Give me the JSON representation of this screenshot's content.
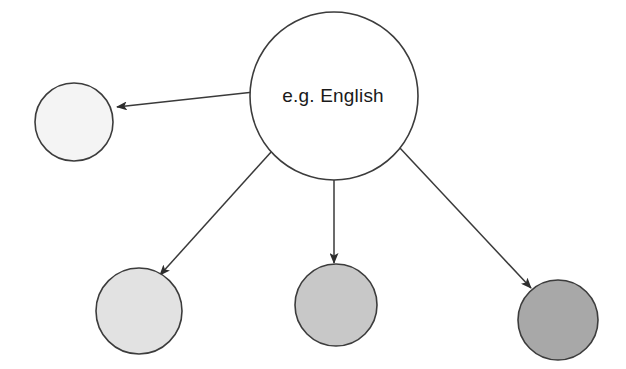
{
  "canvas": {
    "width": 626,
    "height": 369,
    "background": "#ffffff"
  },
  "diagram": {
    "type": "radial-node-link",
    "title": "",
    "nodes": [
      {
        "id": "center",
        "label": "e.g. English",
        "cx": 334,
        "cy": 96,
        "r": 84,
        "fill": "#ffffff",
        "stroke": "#3c3c3c",
        "shade_rank": 0
      },
      {
        "id": "left",
        "label": "",
        "cx": 74,
        "cy": 122,
        "r": 39,
        "fill": "#f4f4f4",
        "stroke": "#3c3c3c",
        "shade_rank": 1
      },
      {
        "id": "bottom-left",
        "label": "",
        "cx": 139,
        "cy": 311,
        "r": 43,
        "fill": "#e2e2e2",
        "stroke": "#3c3c3c",
        "shade_rank": 2
      },
      {
        "id": "bottom-middle",
        "label": "",
        "cx": 336,
        "cy": 305,
        "r": 41,
        "fill": "#c8c8c8",
        "stroke": "#3c3c3c",
        "shade_rank": 3
      },
      {
        "id": "bottom-right",
        "label": "",
        "cx": 558,
        "cy": 320,
        "r": 40,
        "fill": "#a8a8a8",
        "stroke": "#3c3c3c",
        "shade_rank": 4
      }
    ],
    "edges": [
      {
        "id": "edge-center-left",
        "from": "center",
        "to": "left",
        "x1": 254,
        "y1": 92,
        "x2": 117,
        "y2": 107,
        "arrowhead": "end",
        "label": ""
      },
      {
        "id": "edge-center-bottom-left",
        "from": "center",
        "to": "bottom-left",
        "x1": 272,
        "y1": 151,
        "x2": 160,
        "y2": 275,
        "arrowhead": "end",
        "label": ""
      },
      {
        "id": "edge-center-bottom-middle",
        "from": "center",
        "to": "bottom-middle",
        "x1": 334,
        "y1": 180,
        "x2": 334,
        "y2": 263,
        "arrowhead": "end",
        "label": ""
      },
      {
        "id": "edge-center-bottom-right",
        "from": "center",
        "to": "bottom-right",
        "x1": 399,
        "y1": 147,
        "x2": 531,
        "y2": 288,
        "arrowhead": "end",
        "label": ""
      }
    ],
    "style": {
      "edge_color": "#3a3a3a",
      "edge_width": 1.5,
      "node_stroke": "#3c3c3c",
      "node_stroke_width": 1.6,
      "label_color": "#1a1a1a",
      "label_font_size": 19
    }
  }
}
